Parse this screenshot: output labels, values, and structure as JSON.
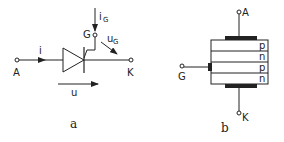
{
  "figure_a": {
    "title": "Thyristor circuit symbol",
    "caption": "a",
    "labels": {
      "anode": "A",
      "cathode": "K",
      "gate": "G",
      "current": "i",
      "gate_current": "i",
      "gate_current_sub": "G",
      "gate_voltage": "u",
      "gate_voltage_sub": "G",
      "voltage": "u"
    }
  },
  "figure_b": {
    "title": "Thyristor layer structure",
    "caption": "b",
    "labels": {
      "anode": "A",
      "cathode": "K",
      "gate": "G"
    },
    "layers": [
      "p",
      "n",
      "p",
      "n"
    ]
  },
  "colors": {
    "line": "#222222",
    "background": "#ffffff"
  }
}
